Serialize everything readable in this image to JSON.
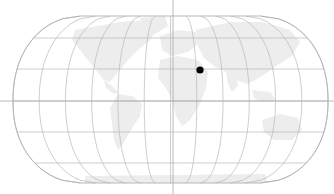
{
  "map": {
    "projection": "robinson-like",
    "width": 334,
    "height": 194,
    "center_x": 170.5,
    "equator_y": 101,
    "half_width": 157.5,
    "top_y": 16,
    "bottom_y": 183,
    "pole_half_width": 90,
    "parallels_y": [
      38,
      69,
      101,
      132,
      163
    ],
    "meridian_count": 13,
    "colors": {
      "background": "#ffffff",
      "graticule": "#b8b8b8",
      "outline": "#b0b0b0",
      "land": "#ededed",
      "crosshair": "#a8a8a8",
      "marker": "#000000"
    }
  },
  "crosshair": {
    "x": 173,
    "y": 101
  },
  "marker": {
    "name": "location-marker",
    "x": 200,
    "y": 70,
    "r": 3.6
  }
}
